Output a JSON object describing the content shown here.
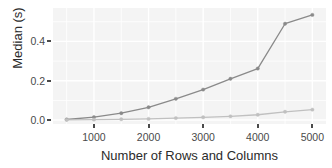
{
  "chart_data": {
    "type": "line",
    "title": "",
    "subtitle": "",
    "xlabel": "Number of Rows and Columns",
    "ylabel": "Median (s)",
    "x": [
      500,
      1000,
      1500,
      2000,
      2500,
      3000,
      3500,
      4000,
      4500,
      5000
    ],
    "xlim": [
      250,
      5250
    ],
    "ylim": [
      -0.02,
      0.57
    ],
    "xticks": [
      1000,
      2000,
      3000,
      4000,
      5000
    ],
    "xtick_labels": [
      "1000",
      "2000",
      "3000",
      "4000",
      "5000"
    ],
    "yticks": [
      0.0,
      0.2,
      0.4
    ],
    "ytick_labels": [
      "0.0",
      "0.2",
      "0.4"
    ],
    "grid": true,
    "grid_color": "#ffffff",
    "panel_background": "#f4f4f4",
    "legend": "none",
    "markers": "filled-circle",
    "series": [
      {
        "name": "upper-series",
        "color": "#8a8a8a",
        "values": [
          0.003,
          0.015,
          0.035,
          0.065,
          0.108,
          0.155,
          0.21,
          0.262,
          0.49,
          0.535
        ]
      },
      {
        "name": "lower-series",
        "color": "#c0c0c0",
        "values": [
          0.001,
          0.002,
          0.004,
          0.006,
          0.01,
          0.014,
          0.019,
          0.027,
          0.042,
          0.053
        ]
      }
    ]
  }
}
